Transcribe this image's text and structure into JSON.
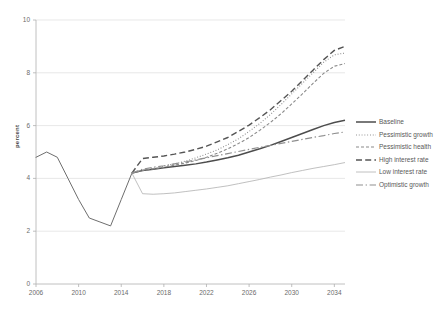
{
  "chart_data": {
    "type": "line",
    "title": "",
    "xlabel": "",
    "ylabel": "percent",
    "xlim": [
      2006,
      2035
    ],
    "ylim": [
      0,
      10
    ],
    "grid": true,
    "legend_position": "right",
    "x_ticks": [
      "2006",
      "2010",
      "2014",
      "2018",
      "2022",
      "2026",
      "2030",
      "2034"
    ],
    "y_ticks": [
      "0",
      "2",
      "4",
      "6",
      "8",
      "10"
    ],
    "history_x": [
      2006,
      2007,
      2008,
      2009,
      2010,
      2011,
      2012,
      2013,
      2014,
      2015
    ],
    "history_y": [
      4.8,
      5.0,
      4.8,
      4.0,
      3.2,
      2.5,
      2.35,
      2.2,
      3.2,
      4.2
    ],
    "projection_x": [
      2015,
      2016,
      2017,
      2018,
      2019,
      2020,
      2021,
      2022,
      2023,
      2024,
      2025,
      2026,
      2027,
      2028,
      2029,
      2030,
      2031,
      2032,
      2033,
      2034,
      2035
    ],
    "series": [
      {
        "name": "Baseline",
        "style": "solid",
        "width": 1.5,
        "color": "#4d4d4d",
        "values": [
          4.2,
          4.3,
          4.35,
          4.4,
          4.45,
          4.5,
          4.55,
          4.62,
          4.7,
          4.78,
          4.88,
          5.0,
          5.12,
          5.25,
          5.4,
          5.55,
          5.7,
          5.85,
          6.0,
          6.12,
          6.2
        ],
        "end_value": 6.2
      },
      {
        "name": "Pessimistic growth",
        "style": "dotted",
        "width": 1.1,
        "color": "#8a8a8a",
        "values": [
          4.2,
          4.3,
          4.38,
          4.46,
          4.55,
          4.65,
          4.78,
          4.92,
          5.08,
          5.28,
          5.5,
          5.78,
          6.08,
          6.42,
          6.8,
          7.2,
          7.6,
          8.0,
          8.4,
          8.68,
          8.75
        ],
        "end_value": 8.75
      },
      {
        "name": "Pessimistic health",
        "style": "dashed-short",
        "width": 1.1,
        "color": "#8a8a8a",
        "values": [
          4.2,
          4.3,
          4.36,
          4.42,
          4.5,
          4.58,
          4.68,
          4.8,
          4.95,
          5.12,
          5.32,
          5.55,
          5.82,
          6.12,
          6.45,
          6.82,
          7.2,
          7.6,
          7.98,
          8.25,
          8.35
        ],
        "end_value": 8.35
      },
      {
        "name": "High interest rate",
        "style": "dashed-long",
        "width": 1.4,
        "color": "#555555",
        "values": [
          4.2,
          4.75,
          4.8,
          4.85,
          4.92,
          5.0,
          5.1,
          5.22,
          5.38,
          5.55,
          5.78,
          6.02,
          6.3,
          6.6,
          6.95,
          7.3,
          7.7,
          8.1,
          8.5,
          8.85,
          9.0
        ],
        "end_value": 9.0
      },
      {
        "name": "Low interest rate",
        "style": "thin-solid",
        "width": 0.8,
        "color": "#b0b0b0",
        "values": [
          4.2,
          3.42,
          3.4,
          3.42,
          3.45,
          3.5,
          3.55,
          3.6,
          3.66,
          3.72,
          3.8,
          3.88,
          3.96,
          4.05,
          4.13,
          4.22,
          4.3,
          4.38,
          4.45,
          4.52,
          4.6
        ],
        "end_value": 4.6
      },
      {
        "name": "Optimistic growth",
        "style": "dash-dot",
        "width": 1.2,
        "color": "#8f8f8f",
        "values": [
          4.2,
          4.35,
          4.42,
          4.48,
          4.55,
          4.62,
          4.7,
          4.78,
          4.86,
          4.94,
          5.02,
          5.1,
          5.18,
          5.25,
          5.33,
          5.4,
          5.48,
          5.55,
          5.62,
          5.7,
          5.76
        ],
        "end_value": 5.76
      }
    ]
  },
  "axis": {
    "ylabel": "percent"
  },
  "legend": {
    "items": [
      {
        "label": "Baseline"
      },
      {
        "label": "Pessimistic growth"
      },
      {
        "label": "Pessimistic health"
      },
      {
        "label": "High interest rate"
      },
      {
        "label": "Low interest rate"
      },
      {
        "label": "Optimistic growth"
      }
    ]
  },
  "caption": {
    "text": ""
  }
}
